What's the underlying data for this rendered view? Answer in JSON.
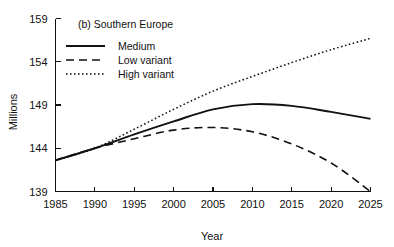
{
  "chart_data": {
    "type": "line",
    "title": "(b) Southern Europe",
    "xlabel": "Year",
    "ylabel": "Millions",
    "xlim": [
      1985,
      2025
    ],
    "ylim": [
      139,
      159
    ],
    "xticks": [
      1985,
      1990,
      1995,
      2000,
      2005,
      2010,
      2015,
      2020,
      2025
    ],
    "yticks": [
      139,
      144,
      149,
      154,
      159
    ],
    "grid": false,
    "legend_position": "top-left inside",
    "x": [
      1985,
      1990,
      1995,
      2000,
      2005,
      2010,
      2015,
      2020,
      2025
    ],
    "series": [
      {
        "name": "Medium",
        "style": "solid",
        "values": [
          142.6,
          144.0,
          145.6,
          147.1,
          148.5,
          149.1,
          148.9,
          148.2,
          147.4
        ]
      },
      {
        "name": "Low variant",
        "style": "dashed",
        "values": [
          142.6,
          144.0,
          145.1,
          146.1,
          146.4,
          145.9,
          144.5,
          142.3,
          139.0
        ]
      },
      {
        "name": "High variant",
        "style": "dotted",
        "values": [
          142.6,
          144.0,
          146.2,
          148.5,
          150.6,
          152.3,
          153.9,
          155.4,
          156.7
        ]
      }
    ]
  },
  "legend": {
    "items": [
      {
        "label": "Medium"
      },
      {
        "label": "Low variant"
      },
      {
        "label": "High variant"
      }
    ]
  },
  "axis": {
    "x_tick_labels": [
      "1985",
      "1990",
      "1995",
      "2000",
      "2005",
      "2010",
      "2015",
      "2020",
      "2025"
    ],
    "y_tick_labels": [
      "139",
      "144",
      "149",
      "154",
      "159"
    ],
    "x_title": "Year",
    "y_title": "Millions"
  },
  "colors": {
    "ink": "#111111",
    "background": "#ffffff"
  }
}
